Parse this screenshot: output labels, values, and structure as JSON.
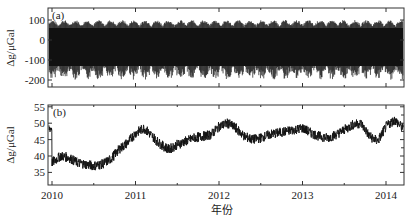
{
  "chart_data": [
    {
      "type": "line",
      "panel_label": "(a)",
      "title": "",
      "xlabel": "",
      "ylabel": "Δg/μGal",
      "xlim": [
        2010.0,
        2014.2
      ],
      "ylim": [
        -240,
        150
      ],
      "yticks": [
        100,
        0,
        -100,
        -200
      ],
      "ytick_labels": [
        "100",
        "0",
        "-100",
        "-200"
      ],
      "xticks": [
        2010,
        2011,
        2012,
        2013,
        2014
      ],
      "grid": false,
      "description": "Dense tidal gravity oscillation, roughly -200 to +100 μGal, continuous over 2010–2014",
      "series": [
        {
          "name": "tidal gravity",
          "envelope_upper": 100,
          "envelope_lower": -200,
          "mean": -40
        }
      ]
    },
    {
      "type": "line",
      "panel_label": "(b)",
      "title": "",
      "xlabel": "年份",
      "ylabel": "Δg/μGal",
      "xlim": [
        2010.0,
        2014.2
      ],
      "ylim": [
        33,
        55
      ],
      "yticks": [
        55,
        50,
        45,
        40,
        35
      ],
      "ytick_labels": [
        "55",
        "50",
        "45",
        "40",
        "35"
      ],
      "xticks": [
        2010,
        2011,
        2012,
        2013,
        2014
      ],
      "xtick_labels": [
        "2010",
        "2011",
        "2012",
        "2013",
        "2014"
      ],
      "grid": false,
      "series": [
        {
          "name": "gravity residual",
          "x": [
            2010.0,
            2010.1,
            2010.2,
            2010.3,
            2010.4,
            2010.5,
            2010.6,
            2010.7,
            2010.8,
            2010.9,
            2011.0,
            2011.1,
            2011.2,
            2011.3,
            2011.4,
            2011.5,
            2011.6,
            2011.7,
            2011.8,
            2011.9,
            2012.0,
            2012.1,
            2012.2,
            2012.3,
            2012.4,
            2012.5,
            2012.6,
            2012.7,
            2012.8,
            2012.9,
            2013.0,
            2013.1,
            2013.2,
            2013.3,
            2013.4,
            2013.5,
            2013.6,
            2013.7,
            2013.8,
            2013.9,
            2014.0,
            2014.1,
            2014.2
          ],
          "values": [
            38,
            40,
            39.5,
            38,
            37.5,
            37,
            37.5,
            39,
            42,
            44,
            47,
            48.5,
            46,
            43.5,
            42,
            43.5,
            44.5,
            45.5,
            46,
            46.5,
            49,
            50,
            48.5,
            46,
            45,
            45.5,
            46.5,
            47,
            47.5,
            48,
            48.5,
            47,
            46,
            45.5,
            46.5,
            48,
            49.5,
            50,
            46,
            44.5,
            49,
            51,
            48.5
          ],
          "noise_amplitude": 1.5
        }
      ]
    }
  ],
  "figure": {
    "top_panel": {
      "label": "(a)",
      "ylabel": "Δg/μGal"
    },
    "bottom_panel": {
      "label": "(b)",
      "ylabel": "Δg/μGal"
    },
    "xlabel": "年份",
    "line_color": "#111111",
    "frame_color": "#333333"
  }
}
